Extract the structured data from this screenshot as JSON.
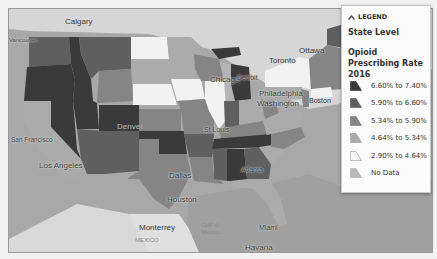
{
  "legend": {
    "toggle_label": "LEGEND",
    "toggle_icon": "chevron-up-icon",
    "level": "State Level",
    "title": "Opioid Prescribing Rate 2016",
    "items": [
      {
        "label": "6.60% to 7.40%",
        "color": "#3a3a3a"
      },
      {
        "label": "5.90% to 6.60%",
        "color": "#5f5f5f"
      },
      {
        "label": "5.34% to 5.90%",
        "color": "#858585"
      },
      {
        "label": "4.64% to 5.34%",
        "color": "#ababab"
      },
      {
        "label": "2.90% to 4.64%",
        "color": "#f2f2f2"
      },
      {
        "label": "No Data",
        "color": "#b9b9b9"
      }
    ]
  },
  "map": {
    "cities": {
      "calgary": "Calgary",
      "vancouver": "Vancouver",
      "ottawa": "Ottawa",
      "toronto": "Toronto",
      "boston": "Boston",
      "chicago": "Chicago",
      "detroit": "Detroit",
      "philadelphia": "Philadelphia",
      "washington": "Washington",
      "san_francisco": "San Francisco",
      "denver": "Denver",
      "st_louis": "St Louis",
      "los_angeles": "Los Angeles",
      "dallas": "Dallas",
      "atlanta": "Atlanta",
      "houston": "Houston",
      "monterrey": "Monterrey",
      "mexico": "MEXICO",
      "gulf": "Gulf of Mexico",
      "miami": "Miami",
      "havana": "Havana"
    }
  }
}
